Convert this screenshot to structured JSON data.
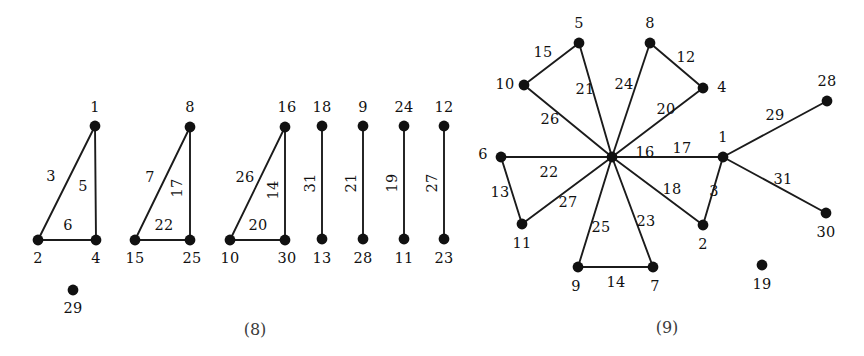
{
  "figure": {
    "width": 864,
    "height": 356,
    "background": "#ffffff",
    "ink_color": "#111111",
    "caption_color": "#3c3c3c"
  },
  "panels": [
    {
      "id": "panel-8",
      "caption": "(8)",
      "caption_pos": [
        255,
        330
      ],
      "nodes": [
        {
          "label": "1",
          "x": 95,
          "y": 126,
          "lx": 95,
          "ly": 108
        },
        {
          "label": "2",
          "x": 38,
          "y": 240,
          "lx": 38,
          "ly": 259
        },
        {
          "label": "4",
          "x": 96,
          "y": 240,
          "lx": 96,
          "ly": 259
        },
        {
          "label": "8",
          "x": 190,
          "y": 127,
          "lx": 190,
          "ly": 108
        },
        {
          "label": "15",
          "x": 135,
          "y": 240,
          "lx": 135,
          "ly": 259
        },
        {
          "label": "25",
          "x": 190,
          "y": 240,
          "lx": 192,
          "ly": 259
        },
        {
          "label": "16",
          "x": 285,
          "y": 127,
          "lx": 287,
          "ly": 108
        },
        {
          "label": "10",
          "x": 230,
          "y": 240,
          "lx": 230,
          "ly": 259
        },
        {
          "label": "30",
          "x": 285,
          "y": 240,
          "lx": 287,
          "ly": 259
        },
        {
          "label": "18",
          "x": 322,
          "y": 126,
          "lx": 322,
          "ly": 108
        },
        {
          "label": "13",
          "x": 322,
          "y": 239,
          "lx": 322,
          "ly": 259
        },
        {
          "label": "9",
          "x": 363,
          "y": 126,
          "lx": 363,
          "ly": 108
        },
        {
          "label": "28",
          "x": 363,
          "y": 239,
          "lx": 363,
          "ly": 259
        },
        {
          "label": "24",
          "x": 404,
          "y": 126,
          "lx": 404,
          "ly": 108
        },
        {
          "label": "11",
          "x": 404,
          "y": 239,
          "lx": 404,
          "ly": 259
        },
        {
          "label": "12",
          "x": 444,
          "y": 126,
          "lx": 444,
          "ly": 108
        },
        {
          "label": "23",
          "x": 444,
          "y": 239,
          "lx": 444,
          "ly": 259
        },
        {
          "label": "29",
          "x": 73,
          "y": 290,
          "lx": 73,
          "ly": 309
        }
      ],
      "edges": [
        {
          "from": "1",
          "to": "2",
          "weight": "3",
          "lx": 51,
          "ly": 177,
          "rot": 0
        },
        {
          "from": "1",
          "to": "4",
          "weight": "5",
          "lx": 83,
          "ly": 187,
          "rot": 0
        },
        {
          "from": "2",
          "to": "4",
          "weight": "6",
          "lx": 68,
          "ly": 226,
          "rot": 0
        },
        {
          "from": "8",
          "to": "15",
          "weight": "7",
          "lx": 150,
          "ly": 178,
          "rot": 0
        },
        {
          "from": "8",
          "to": "25",
          "weight": "17",
          "lx": 178,
          "ly": 188,
          "rot": -90
        },
        {
          "from": "15",
          "to": "25",
          "weight": "22",
          "lx": 164,
          "ly": 226,
          "rot": 0
        },
        {
          "from": "16",
          "to": "10",
          "weight": "26",
          "lx": 245,
          "ly": 178,
          "rot": 0
        },
        {
          "from": "16",
          "to": "30",
          "weight": "14",
          "lx": 274,
          "ly": 190,
          "rot": -90
        },
        {
          "from": "10",
          "to": "30",
          "weight": "20",
          "lx": 258,
          "ly": 226,
          "rot": 0
        },
        {
          "from": "18",
          "to": "13",
          "weight": "31",
          "lx": 311,
          "ly": 183,
          "rot": -90
        },
        {
          "from": "9",
          "to": "28",
          "weight": "21",
          "lx": 352,
          "ly": 183,
          "rot": -90
        },
        {
          "from": "24",
          "to": "11",
          "weight": "19",
          "lx": 393,
          "ly": 183,
          "rot": -90
        },
        {
          "from": "12",
          "to": "23",
          "weight": "27",
          "lx": 433,
          "ly": 183,
          "rot": -90
        }
      ]
    },
    {
      "id": "panel-9",
      "caption": "(9)",
      "caption_pos": [
        667,
        328
      ],
      "nodes": [
        {
          "label": "16",
          "x": 612,
          "y": 157,
          "lx": 645,
          "ly": 153
        },
        {
          "label": "5",
          "x": 579,
          "y": 43,
          "lx": 579,
          "ly": 24
        },
        {
          "label": "8",
          "x": 650,
          "y": 43,
          "lx": 650,
          "ly": 24
        },
        {
          "label": "10",
          "x": 524,
          "y": 85,
          "lx": 505,
          "ly": 85
        },
        {
          "label": "4",
          "x": 703,
          "y": 88,
          "lx": 722,
          "ly": 88
        },
        {
          "label": "6",
          "x": 501,
          "y": 157,
          "lx": 483,
          "ly": 155
        },
        {
          "label": "11",
          "x": 522,
          "y": 224,
          "lx": 522,
          "ly": 244
        },
        {
          "label": "9",
          "x": 578,
          "y": 267,
          "lx": 576,
          "ly": 287
        },
        {
          "label": "7",
          "x": 653,
          "y": 267,
          "lx": 655,
          "ly": 287
        },
        {
          "label": "2",
          "x": 703,
          "y": 225,
          "lx": 703,
          "ly": 245
        },
        {
          "label": "1",
          "x": 723,
          "y": 157,
          "lx": 723,
          "ly": 138
        },
        {
          "label": "28",
          "x": 827,
          "y": 101,
          "lx": 827,
          "ly": 82
        },
        {
          "label": "30",
          "x": 826,
          "y": 213,
          "lx": 826,
          "ly": 233
        },
        {
          "label": "19",
          "x": 762,
          "y": 265,
          "lx": 762,
          "ly": 285
        }
      ],
      "edges": [
        {
          "from": "5",
          "to": "10",
          "weight": "15",
          "lx": 543,
          "ly": 53,
          "rot": 0
        },
        {
          "from": "5",
          "to": "16",
          "weight": "21",
          "lx": 585,
          "ly": 90,
          "rot": 0
        },
        {
          "from": "10",
          "to": "16",
          "weight": "26",
          "lx": 550,
          "ly": 120,
          "rot": 0
        },
        {
          "from": "8",
          "to": "16",
          "weight": "24",
          "lx": 624,
          "ly": 85,
          "rot": 0
        },
        {
          "from": "8",
          "to": "4",
          "weight": "12",
          "lx": 686,
          "ly": 58,
          "rot": 0
        },
        {
          "from": "4",
          "to": "16",
          "weight": "20",
          "lx": 666,
          "ly": 110,
          "rot": 0
        },
        {
          "from": "16",
          "to": "1",
          "weight": "17",
          "lx": 682,
          "ly": 149,
          "rot": 0
        },
        {
          "from": "6",
          "to": "16",
          "weight": "22",
          "lx": 549,
          "ly": 173,
          "rot": 0
        },
        {
          "from": "6",
          "to": "11",
          "weight": "13",
          "lx": 500,
          "ly": 193,
          "rot": 0
        },
        {
          "from": "11",
          "to": "16",
          "weight": "27",
          "lx": 568,
          "ly": 203,
          "rot": 0
        },
        {
          "from": "9",
          "to": "16",
          "weight": "25",
          "lx": 601,
          "ly": 228,
          "rot": 0
        },
        {
          "from": "9",
          "to": "7",
          "weight": "14",
          "lx": 616,
          "ly": 283,
          "rot": 0
        },
        {
          "from": "7",
          "to": "16",
          "weight": "23",
          "lx": 646,
          "ly": 222,
          "rot": 0
        },
        {
          "from": "2",
          "to": "16",
          "weight": "18",
          "lx": 672,
          "ly": 190,
          "rot": 0
        },
        {
          "from": "2",
          "to": "1",
          "weight": "3",
          "lx": 714,
          "ly": 192,
          "rot": 0
        },
        {
          "from": "1",
          "to": "28",
          "weight": "29",
          "lx": 775,
          "ly": 116,
          "rot": 0
        },
        {
          "from": "1",
          "to": "30",
          "weight": "31",
          "lx": 783,
          "ly": 180,
          "rot": 0
        }
      ]
    }
  ],
  "graph_data": {
    "type": "node-link-diagram",
    "description": "Two panels of weighted undirected graphs with numbered vertices and numbered edge weights",
    "panel_8": {
      "caption": "(8)",
      "vertices": [
        1,
        2,
        4,
        8,
        15,
        25,
        16,
        10,
        30,
        18,
        13,
        9,
        28,
        24,
        11,
        12,
        23,
        29
      ],
      "isolated_vertices": [
        29
      ],
      "edges": [
        {
          "u": 1,
          "v": 2,
          "w": 3
        },
        {
          "u": 1,
          "v": 4,
          "w": 5
        },
        {
          "u": 2,
          "v": 4,
          "w": 6
        },
        {
          "u": 8,
          "v": 15,
          "w": 7
        },
        {
          "u": 8,
          "v": 25,
          "w": 17
        },
        {
          "u": 15,
          "v": 25,
          "w": 22
        },
        {
          "u": 16,
          "v": 10,
          "w": 26
        },
        {
          "u": 16,
          "v": 30,
          "w": 14
        },
        {
          "u": 10,
          "v": 30,
          "w": 20
        },
        {
          "u": 18,
          "v": 13,
          "w": 31
        },
        {
          "u": 9,
          "v": 28,
          "w": 21
        },
        {
          "u": 24,
          "v": 11,
          "w": 19
        },
        {
          "u": 12,
          "v": 23,
          "w": 27
        }
      ]
    },
    "panel_9": {
      "caption": "(9)",
      "vertices": [
        16,
        5,
        8,
        10,
        4,
        6,
        11,
        9,
        7,
        2,
        1,
        28,
        30,
        19
      ],
      "isolated_vertices": [
        19
      ],
      "hub": 16,
      "edges": [
        {
          "u": 5,
          "v": 10,
          "w": 15
        },
        {
          "u": 5,
          "v": 16,
          "w": 21
        },
        {
          "u": 10,
          "v": 16,
          "w": 26
        },
        {
          "u": 8,
          "v": 16,
          "w": 24
        },
        {
          "u": 8,
          "v": 4,
          "w": 12
        },
        {
          "u": 4,
          "v": 16,
          "w": 20
        },
        {
          "u": 16,
          "v": 1,
          "w": 17
        },
        {
          "u": 6,
          "v": 16,
          "w": 22
        },
        {
          "u": 6,
          "v": 11,
          "w": 13
        },
        {
          "u": 11,
          "v": 16,
          "w": 27
        },
        {
          "u": 9,
          "v": 16,
          "w": 25
        },
        {
          "u": 9,
          "v": 7,
          "w": 14
        },
        {
          "u": 7,
          "v": 16,
          "w": 23
        },
        {
          "u": 2,
          "v": 16,
          "w": 18
        },
        {
          "u": 2,
          "v": 1,
          "w": 3
        },
        {
          "u": 1,
          "v": 28,
          "w": 29
        },
        {
          "u": 1,
          "v": 30,
          "w": 31
        }
      ]
    }
  }
}
